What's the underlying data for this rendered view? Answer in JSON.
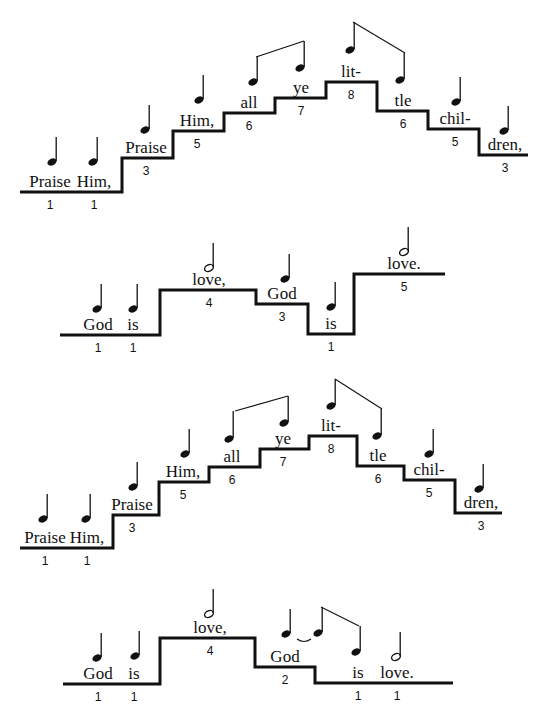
{
  "diagrams": [
    {
      "name": "praise-him-1",
      "stair": [
        [
          20,
          192
        ],
        [
          122,
          192
        ],
        [
          122,
          158
        ],
        [
          173,
          158
        ],
        [
          173,
          131
        ],
        [
          224,
          131
        ],
        [
          224,
          113
        ],
        [
          275,
          113
        ],
        [
          275,
          98
        ],
        [
          326,
          98
        ],
        [
          326,
          82
        ],
        [
          377,
          82
        ],
        [
          377,
          111
        ],
        [
          428,
          111
        ],
        [
          428,
          129
        ],
        [
          479,
          129
        ],
        [
          479,
          155
        ],
        [
          528,
          155
        ]
      ],
      "syllables": [
        {
          "text": "Praise",
          "degree": "1",
          "x": 50,
          "y": 192,
          "note": "quarter",
          "nx": 52,
          "ny": 162
        },
        {
          "text": "Him,",
          "degree": "1",
          "x": 94,
          "y": 192,
          "note": "quarter",
          "nx": 93,
          "ny": 162
        },
        {
          "text": "Praise",
          "degree": "3",
          "x": 146,
          "y": 158,
          "note": "quarter",
          "nx": 145,
          "ny": 130
        },
        {
          "text": "Him,",
          "degree": "5",
          "x": 197,
          "y": 131,
          "note": "quarter",
          "nx": 199,
          "ny": 100
        },
        {
          "text": "all",
          "degree": "6",
          "x": 249,
          "y": 113,
          "note": "quarter-beamed",
          "nx": 253,
          "ny": 82
        },
        {
          "text": "ye",
          "degree": "7",
          "x": 301,
          "y": 98,
          "note": "quarter-beamed",
          "nx": 300,
          "ny": 68
        },
        {
          "text": "lit-",
          "degree": "8",
          "x": 351,
          "y": 82,
          "note": "quarter-beamed",
          "nx": 350,
          "ny": 50
        },
        {
          "text": "tle",
          "degree": "6",
          "x": 403,
          "y": 111,
          "note": "quarter-beamed",
          "nx": 400,
          "ny": 80
        },
        {
          "text": "chil-",
          "degree": "5",
          "x": 455,
          "y": 129,
          "note": "quarter",
          "nx": 456,
          "ny": 102
        },
        {
          "text": "dren,",
          "degree": "3",
          "x": 505,
          "y": 155,
          "note": "quarter",
          "nx": 504,
          "ny": 131
        }
      ],
      "beams": [
        [
          [
            256,
            57
          ],
          [
            304,
            41
          ]
        ],
        [
          [
            353,
            22
          ],
          [
            405,
            53
          ]
        ]
      ]
    },
    {
      "name": "god-is-love-1",
      "stair": [
        [
          60,
          335
        ],
        [
          160,
          335
        ],
        [
          160,
          290
        ],
        [
          256,
          290
        ],
        [
          256,
          304
        ],
        [
          308,
          304
        ],
        [
          308,
          334
        ],
        [
          354,
          334
        ],
        [
          354,
          274
        ],
        [
          445,
          274
        ]
      ],
      "syllables": [
        {
          "text": "God",
          "degree": "1",
          "x": 98,
          "y": 335,
          "note": "quarter",
          "nx": 97,
          "ny": 309
        },
        {
          "text": "is",
          "degree": "1",
          "x": 133,
          "y": 335,
          "note": "quarter",
          "nx": 133,
          "ny": 309
        },
        {
          "text": "love,",
          "degree": "4",
          "x": 209,
          "y": 290,
          "note": "half",
          "nx": 209,
          "ny": 268
        },
        {
          "text": "God",
          "degree": "3",
          "x": 282,
          "y": 304,
          "note": "quarter",
          "nx": 285,
          "ny": 279
        },
        {
          "text": "is",
          "degree": "1",
          "x": 331,
          "y": 334,
          "note": "quarter",
          "nx": 331,
          "ny": 307
        },
        {
          "text": "love.",
          "degree": "5",
          "x": 404,
          "y": 274,
          "note": "half",
          "nx": 404,
          "ny": 252
        }
      ],
      "beams": []
    },
    {
      "name": "praise-him-2",
      "stair": [
        [
          20,
          548
        ],
        [
          113,
          548
        ],
        [
          113,
          515
        ],
        [
          159,
          515
        ],
        [
          159,
          482
        ],
        [
          209,
          482
        ],
        [
          209,
          467
        ],
        [
          260,
          467
        ],
        [
          260,
          449
        ],
        [
          309,
          449
        ],
        [
          309,
          436
        ],
        [
          357,
          436
        ],
        [
          357,
          466
        ],
        [
          404,
          466
        ],
        [
          404,
          480
        ],
        [
          455,
          480
        ],
        [
          455,
          513
        ],
        [
          502,
          513
        ]
      ],
      "syllables": [
        {
          "text": "Praise",
          "degree": "1",
          "x": 45,
          "y": 548,
          "note": "quarter",
          "nx": 43,
          "ny": 519
        },
        {
          "text": "Him,",
          "degree": "1",
          "x": 87,
          "y": 548,
          "note": "quarter",
          "nx": 86,
          "ny": 519
        },
        {
          "text": "Praise",
          "degree": "3",
          "x": 132,
          "y": 515,
          "note": "quarter",
          "nx": 133,
          "ny": 487
        },
        {
          "text": "Him,",
          "degree": "5",
          "x": 183,
          "y": 482,
          "note": "quarter",
          "nx": 185,
          "ny": 454
        },
        {
          "text": "all",
          "degree": "6",
          "x": 232,
          "y": 467,
          "note": "quarter-beamed",
          "nx": 229,
          "ny": 439
        },
        {
          "text": "ye",
          "degree": "7",
          "x": 283,
          "y": 449,
          "note": "quarter-beamed",
          "nx": 284,
          "ny": 423
        },
        {
          "text": "lit-",
          "degree": "8",
          "x": 331,
          "y": 436,
          "note": "quarter-beamed",
          "nx": 331,
          "ny": 406
        },
        {
          "text": "tle",
          "degree": "6",
          "x": 378,
          "y": 466,
          "note": "quarter-beamed",
          "nx": 377,
          "ny": 436
        },
        {
          "text": "chil-",
          "degree": "5",
          "x": 429,
          "y": 480,
          "note": "quarter",
          "nx": 429,
          "ny": 454
        },
        {
          "text": "dren,",
          "degree": "3",
          "x": 481,
          "y": 513,
          "note": "quarter",
          "nx": 479,
          "ny": 489
        }
      ],
      "beams": [
        [
          [
            235,
            411
          ],
          [
            288,
            396
          ]
        ],
        [
          [
            335,
            379
          ],
          [
            382,
            409
          ]
        ]
      ]
    },
    {
      "name": "god-is-love-2",
      "stair": [
        [
          63,
          684
        ],
        [
          160,
          684
        ],
        [
          160,
          638
        ],
        [
          255,
          638
        ],
        [
          255,
          667
        ],
        [
          315,
          667
        ],
        [
          315,
          683
        ],
        [
          453,
          683
        ]
      ],
      "syllables": [
        {
          "text": "God",
          "degree": "1",
          "x": 98,
          "y": 684,
          "note": "quarter",
          "nx": 97,
          "ny": 658
        },
        {
          "text": "is",
          "degree": "1",
          "x": 134,
          "y": 684,
          "note": "quarter",
          "nx": 135,
          "ny": 656
        },
        {
          "text": "love,",
          "degree": "4",
          "x": 210,
          "y": 638,
          "note": "half",
          "nx": 209,
          "ny": 614
        },
        {
          "text": "God",
          "degree": "2",
          "x": 285,
          "y": 667,
          "note": "quarter-tied",
          "nx": 286,
          "ny": 634
        },
        {
          "text": "",
          "degree": "",
          "x": 0,
          "y": 0,
          "note": "quarter-beamed",
          "nx": 318,
          "ny": 633
        },
        {
          "text": "is",
          "degree": "1",
          "x": 358,
          "y": 683,
          "note": "quarter-beamed",
          "nx": 356,
          "ny": 652
        },
        {
          "text": "love.",
          "degree": "1",
          "x": 397,
          "y": 683,
          "note": "half",
          "nx": 396,
          "ny": 657
        }
      ],
      "beams": [
        [
          [
            321,
            607
          ],
          [
            359,
            626
          ]
        ]
      ],
      "ties": [
        [
          [
            297,
            639
          ],
          [
            311,
            639
          ]
        ]
      ]
    }
  ]
}
